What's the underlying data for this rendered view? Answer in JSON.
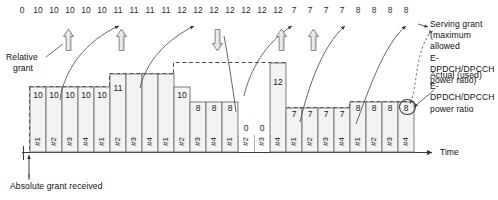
{
  "figure": {
    "axis": {
      "time_label": "Time"
    },
    "annotations": {
      "relative_grant": "Relative\ngrant",
      "relative_grant_line1": "Relative",
      "relative_grant_line2": "grant",
      "absolute_grant": "Absolute grant received",
      "serving_grant_l1": "Serving grant",
      "serving_grant_l2": "(maximum allowed",
      "serving_grant_l3": "E-DPDCH/DPCCH",
      "serving_grant_l4": "power ratio)",
      "actual_used_l1": "Actual (used)",
      "actual_used_l2": "E-DPDCH/DPCCH",
      "actual_used_l3": "power ratio"
    },
    "icons": {
      "up_arrow": "block-arrow-up-icon",
      "down_arrow": "block-arrow-down-icon",
      "time_arrow": "arrow-right-icon",
      "absolute_grant_arrow": "arrow-up-icon"
    }
  },
  "chart_data": {
    "type": "bar",
    "xlabel": "Time",
    "ylabel": "",
    "grid": false,
    "legend": "none",
    "serving_grant_label": "Serving grant (maximum allowed E-DPDCH/DPCCH power ratio)",
    "actual_label": "Actual (used) E-DPDCH/DPCCH power ratio",
    "serving_grant_sequence": [
      0,
      10,
      10,
      10,
      10,
      10,
      11,
      11,
      11,
      11,
      12,
      12,
      12,
      12,
      12,
      12,
      12,
      7,
      7,
      7,
      7,
      8,
      8,
      8,
      8
    ],
    "categories": [
      "#1",
      "#2",
      "#3",
      "#4",
      "#1",
      "#2",
      "#3",
      "#4",
      "#1",
      "#2",
      "#3",
      "#4",
      "#1",
      "#2",
      "#3",
      "#4",
      "#1",
      "#2",
      "#3",
      "#4",
      "#1",
      "#2",
      "#3",
      "#4"
    ],
    "values": [
      10,
      10,
      10,
      10,
      10,
      11,
      11,
      11,
      11,
      10,
      8,
      8,
      8,
      0,
      0,
      12,
      7,
      7,
      7,
      7,
      8,
      8,
      8,
      8
    ],
    "value_labels": [
      "10",
      "10",
      "10",
      "10",
      "10",
      "11",
      "",
      "",
      "",
      "10",
      "8",
      "8",
      "8",
      "0",
      "0",
      "12",
      "7",
      "7",
      "7",
      "7",
      "8",
      "8",
      "8",
      "8"
    ],
    "highlighted_index": 23,
    "highlighted_value": 8,
    "ylim": [
      0,
      13
    ],
    "grant_step_events": [
      {
        "type": "relative-grant-up",
        "after_index": 4
      },
      {
        "type": "relative-grant-up",
        "after_index": 8
      },
      {
        "type": "relative-grant-down",
        "after_index": 15
      },
      {
        "type": "relative-grant-up",
        "after_index": 17
      },
      {
        "type": "relative-grant-up",
        "after_index": 19
      }
    ]
  }
}
